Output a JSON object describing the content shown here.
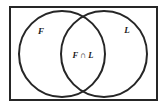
{
  "figure": {
    "universe_label": "",
    "stroke_color": "#262626",
    "fill_color": "#ffffff",
    "background_color": "#ffffff",
    "border_width": 2,
    "circle_stroke_width": 2
  },
  "labels": {
    "left_set": "F",
    "right_set": "L",
    "intersection": "F ∩ L"
  },
  "chart_data": {
    "type": "diagram",
    "diagram_type": "venn",
    "sets": [
      {
        "name": "F",
        "label": "F",
        "cx": 62,
        "cy": 54,
        "r": 43
      },
      {
        "name": "L",
        "label": "L",
        "cx": 104,
        "cy": 54,
        "r": 43
      }
    ],
    "regions": [
      {
        "name": "F_only",
        "label": "F"
      },
      {
        "name": "L_only",
        "label": "L"
      },
      {
        "name": "F_and_L",
        "label": "F ∩ L"
      }
    ],
    "universe": {
      "x": 9,
      "y": 6,
      "width": 149,
      "height": 95
    },
    "title": "",
    "legend": "none",
    "grid": false
  }
}
